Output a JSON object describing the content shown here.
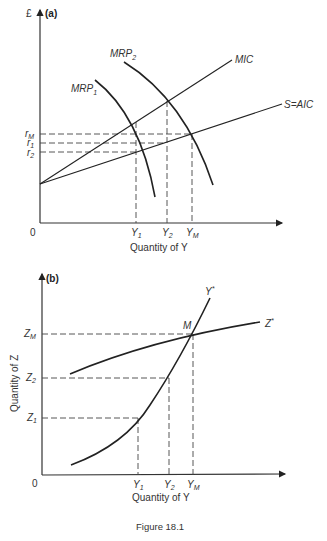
{
  "figure": {
    "caption": "Figure 18.1"
  },
  "panel_a": {
    "label": "(a)",
    "y_axis_label": "£",
    "origin_label": "0",
    "x_axis_label": "Quantity of Y",
    "curves": {
      "mrp1": {
        "name": "MRP",
        "sub": "1"
      },
      "mrp2": {
        "name": "MRP",
        "sub": "2"
      },
      "mic": {
        "name": "MIC"
      },
      "aic": {
        "name": "S=AIC"
      }
    },
    "y_ticks": [
      {
        "name": "r",
        "sub": "M"
      },
      {
        "name": "r",
        "sub": "1"
      },
      {
        "name": "r",
        "sub": "2"
      }
    ],
    "x_ticks": [
      {
        "name": "Y",
        "sub": "1"
      },
      {
        "name": "Y",
        "sub": "2"
      },
      {
        "name": "Y",
        "sub": "M"
      }
    ]
  },
  "panel_b": {
    "label": "(b)",
    "y_axis_label": "Quantity of Z",
    "origin_label": "0",
    "x_axis_label": "Quantity of Y",
    "point_label": "M",
    "curves": {
      "ystar": {
        "name": "Y",
        "sup": "*"
      },
      "zstar": {
        "name": "Z",
        "sup": "*"
      }
    },
    "y_ticks": [
      {
        "name": "Z",
        "sub": "M"
      },
      {
        "name": "Z",
        "sub": "2"
      },
      {
        "name": "Z",
        "sub": "1"
      }
    ],
    "x_ticks": [
      {
        "name": "Y",
        "sub": "1"
      },
      {
        "name": "Y",
        "sub": "2"
      },
      {
        "name": "Y",
        "sub": "M"
      }
    ]
  }
}
